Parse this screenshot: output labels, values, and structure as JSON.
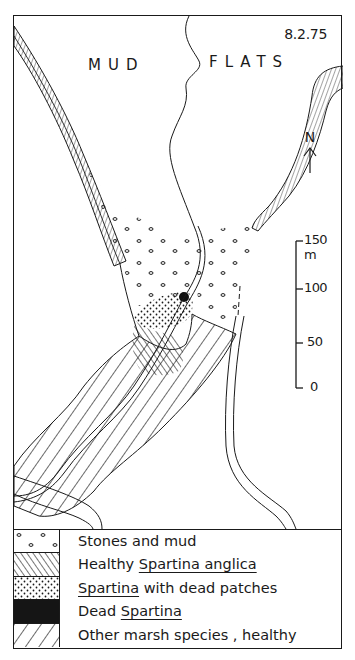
{
  "map": {
    "date": "8.2.75",
    "labels": {
      "mud": "MUD",
      "flats": "FLATS"
    },
    "north_label": "N",
    "scale": {
      "unit": "m",
      "ticks": [
        {
          "value": "150 m",
          "y": 240
        },
        {
          "value": "100",
          "y": 288
        },
        {
          "value": "50",
          "y": 342
        },
        {
          "value": "0",
          "y": 387
        }
      ]
    }
  },
  "legend": {
    "items": [
      {
        "key": "stones",
        "pattern": "open-circles",
        "text": "Stones and mud"
      },
      {
        "key": "healthy",
        "pattern": "dense-diagonal-hatch",
        "text_plain": "Healthy ",
        "text_underlined": "Spartina anglica"
      },
      {
        "key": "dead-patches",
        "pattern": "fine-stipple",
        "text_underlined": "Spartina",
        "text_plain": " with dead patches"
      },
      {
        "key": "dead",
        "pattern": "solid-black",
        "text_plain": "Dead ",
        "text_underlined": "Spartina"
      },
      {
        "key": "other",
        "pattern": "wide-diagonal-hatch",
        "text": "Other marsh species , healthy"
      }
    ]
  },
  "colors": {
    "ink": "#1a1a1a",
    "paper": "#ffffff"
  }
}
